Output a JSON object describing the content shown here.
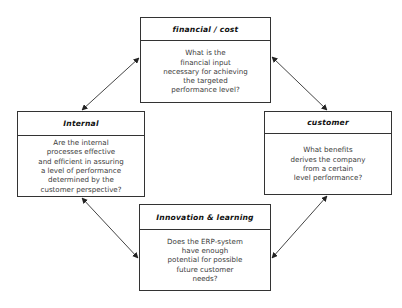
{
  "diagram": {
    "type": "balanced-scorecard-cycle",
    "boxes": {
      "financial": {
        "title": "financial / cost",
        "question": "What is the\nfinancial input\nnecessary for achieving\nthe targeted\nperformance level?"
      },
      "internal": {
        "title": "Internal",
        "question": "Are the internal\nprocesses effective\nand efficient in assuring\na level of performance\ndetermined by the\ncustomer perspective?"
      },
      "customer": {
        "title": "customer",
        "question": "What benefits\nderives the company\nfrom a certain\nlevel performance?"
      },
      "innovation": {
        "title": "Innovation & learning",
        "question": "Does the ERP-system\nhave enough\npotential for possible\nfuture customer\nneeds?"
      }
    },
    "connections": [
      {
        "from": "internal",
        "to": "financial",
        "bidirectional": true
      },
      {
        "from": "financial",
        "to": "customer",
        "bidirectional": true
      },
      {
        "from": "customer",
        "to": "innovation",
        "bidirectional": true
      },
      {
        "from": "innovation",
        "to": "internal",
        "bidirectional": true
      }
    ],
    "colors": {
      "line": "#333333",
      "background": "#ffffff",
      "text": "#3a3a3a"
    }
  }
}
